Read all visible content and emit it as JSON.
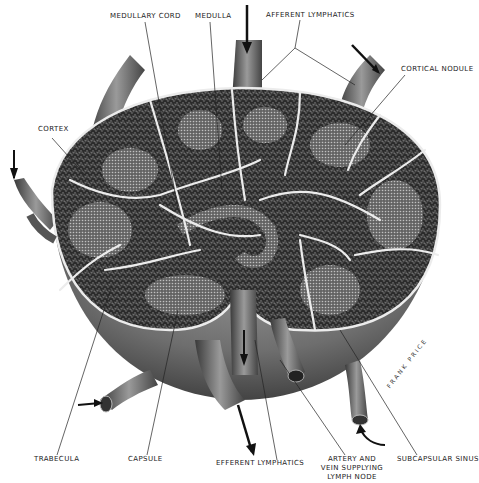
{
  "diagram": {
    "labels": {
      "medullary_cord": "MEDULLARY CORD",
      "medulla": "MEDULLA",
      "afferent_lymphatics": "AFFERENT LYMPHATICS",
      "cortical_nodule": "CORTICAL NODULE",
      "cortex": "CORTEX",
      "trabecula": "TRABECULA",
      "capsule": "CAPSULE",
      "efferent_lymphatics": "EFFERENT LYMPHATICS",
      "artery_and_vein": "ARTERY AND VEIN SUPPLYING LYMPH NODE",
      "subcapsular_sinus": "SUBCAPSULAR SINUS"
    },
    "signature": "FRANK PRICE",
    "colors": {
      "background": "#ffffff",
      "capsule_shade": "#7a7a7a",
      "tissue_dark": "#2e2e2e",
      "trabecula_light": "#e8e8e8",
      "leader_line": "#222222"
    }
  }
}
